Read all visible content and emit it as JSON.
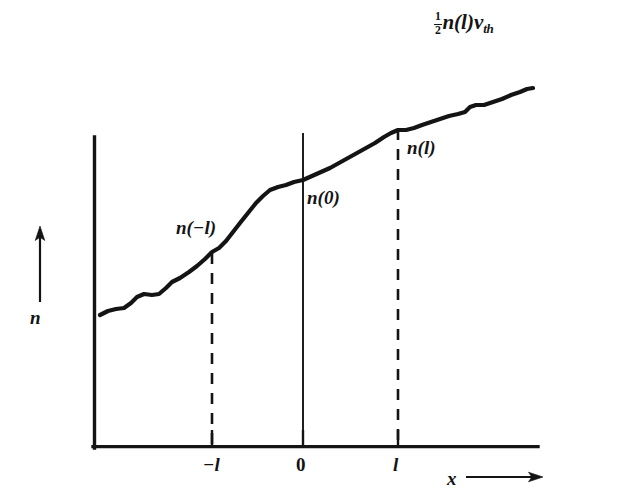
{
  "figure": {
    "kind": "line-plot-diagram",
    "background_color": "#ffffff",
    "ink_color": "#141414",
    "flux_label": {
      "numerator": "1",
      "denominator": "2",
      "expression": "n(l)",
      "symbol": "v",
      "subscript": "th",
      "full_text": "1/2 n(l) v_th"
    },
    "axes": {
      "y_label": "n",
      "x_label": "x",
      "y_arrow": "up-arrow",
      "x_arrow": "right-arrow",
      "origin_px": [
        93,
        448
      ],
      "x_axis_end_px": [
        538,
        448
      ],
      "y_axis_top_px": [
        93,
        137
      ]
    },
    "ticks": [
      {
        "label": "−l",
        "x_px": 212
      },
      {
        "label": "0",
        "x_px": 303
      },
      {
        "label": "l",
        "x_px": 398
      }
    ],
    "curve_labels": [
      {
        "id": "n-minus-l",
        "text": "n(−l)"
      },
      {
        "id": "n-zero",
        "text": "n(0)"
      },
      {
        "id": "n-l",
        "text": "n(l)"
      }
    ],
    "markers": [
      {
        "name": "dashed-line-minus-l",
        "x_px": 212,
        "style": "dashed",
        "top_px": 253,
        "bottom_px": 448
      },
      {
        "name": "solid-line-zero",
        "x_px": 303,
        "style": "solid",
        "top_px": 133,
        "bottom_px": 448
      },
      {
        "name": "dashed-line-l",
        "x_px": 398,
        "style": "dashed",
        "top_px": 129,
        "bottom_px": 448
      }
    ]
  },
  "chart_data": {
    "type": "line",
    "title": "",
    "xlabel": "x",
    "ylabel": "n",
    "grid": false,
    "legend": null,
    "xlim": [
      93,
      538
    ],
    "ylim": [
      448,
      80
    ],
    "xticks": [
      {
        "value": -1,
        "label": "−l",
        "px": 212
      },
      {
        "value": 0,
        "label": "0",
        "px": 303
      },
      {
        "value": 1,
        "label": "l",
        "px": 398
      }
    ],
    "series": [
      {
        "name": "n(x)",
        "color": "#141414",
        "line_width": 4.2,
        "points_px": [
          [
            100,
            315
          ],
          [
            108,
            311
          ],
          [
            116,
            309
          ],
          [
            124,
            308
          ],
          [
            131,
            303
          ],
          [
            137,
            297
          ],
          [
            144,
            294
          ],
          [
            152,
            295
          ],
          [
            159,
            294
          ],
          [
            166,
            288
          ],
          [
            172,
            282
          ],
          [
            180,
            278
          ],
          [
            189,
            272
          ],
          [
            197,
            266
          ],
          [
            205,
            259
          ],
          [
            212,
            252
          ],
          [
            219,
            248
          ],
          [
            226,
            241
          ],
          [
            233,
            232
          ],
          [
            240,
            223
          ],
          [
            248,
            213
          ],
          [
            256,
            203
          ],
          [
            263,
            196
          ],
          [
            270,
            190
          ],
          [
            278,
            187
          ],
          [
            286,
            185
          ],
          [
            294,
            182
          ],
          [
            303,
            180
          ],
          [
            312,
            176
          ],
          [
            321,
            172
          ],
          [
            330,
            168
          ],
          [
            339,
            163
          ],
          [
            348,
            158
          ],
          [
            357,
            153
          ],
          [
            366,
            148
          ],
          [
            375,
            143
          ],
          [
            384,
            137
          ],
          [
            391,
            133
          ],
          [
            398,
            130
          ],
          [
            406,
            130
          ],
          [
            414,
            128
          ],
          [
            422,
            125
          ],
          [
            431,
            122
          ],
          [
            440,
            119
          ],
          [
            449,
            116
          ],
          [
            458,
            114
          ],
          [
            465,
            112
          ],
          [
            470,
            107
          ],
          [
            476,
            105
          ],
          [
            484,
            105
          ],
          [
            493,
            102
          ],
          [
            502,
            99
          ],
          [
            511,
            95
          ],
          [
            520,
            92
          ],
          [
            527,
            89
          ],
          [
            533,
            88
          ]
        ]
      }
    ],
    "annotations": [
      {
        "text": "n(−l)",
        "x_px": 176,
        "y_px": 218
      },
      {
        "text": "n(0)",
        "x_px": 307,
        "y_px": 188
      },
      {
        "text": "n(l)",
        "x_px": 407,
        "y_px": 138
      },
      {
        "text": "1/2 n(l) v_th",
        "x_px": 434,
        "y_px": 11
      }
    ]
  }
}
